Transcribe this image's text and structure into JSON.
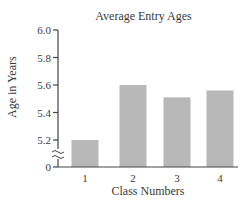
{
  "chart_data": {
    "type": "bar",
    "title": "Average Entry Ages",
    "xlabel": "Class Numbers",
    "ylabel": "Age in Years",
    "categories": [
      "1",
      "2",
      "3",
      "4"
    ],
    "values": [
      5.2,
      5.6,
      5.51,
      5.56
    ],
    "ylim": [
      5.1,
      6.0
    ],
    "y_ticks": [
      "0",
      "5.2",
      "5.4",
      "5.6",
      "5.8",
      "6.0"
    ],
    "y_axis_break": true,
    "grid": false,
    "legend": null,
    "bar_color": "#b8b8b8"
  }
}
